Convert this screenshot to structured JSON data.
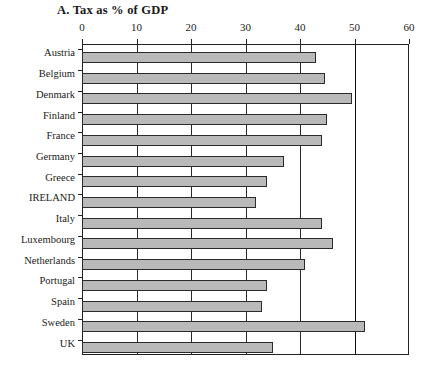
{
  "chart_data": {
    "type": "bar",
    "orientation": "horizontal",
    "title": "A. Tax as % of GDP",
    "xlabel": "",
    "ylabel": "",
    "xlim": [
      0,
      60
    ],
    "xticks": [
      0,
      10,
      20,
      30,
      40,
      50,
      60
    ],
    "grid": true,
    "grid_axis": "x",
    "legend": false,
    "categories": [
      "Austria",
      "Belgium",
      "Denmark",
      "Finland",
      "France",
      "Germany",
      "Greece",
      "IRELAND",
      "Italy",
      "Luxembourg",
      "Netherlands",
      "Portugal",
      "Spain",
      "Sweden",
      "UK"
    ],
    "values": [
      43,
      44.5,
      49.5,
      45,
      44,
      37,
      34,
      32,
      44,
      46,
      41,
      34,
      33,
      52,
      35
    ],
    "series": [
      {
        "name": "Tax as % of GDP",
        "values": [
          43,
          44.5,
          49.5,
          45,
          44,
          37,
          34,
          32,
          44,
          46,
          41,
          34,
          33,
          52,
          35
        ]
      }
    ],
    "bar_fill_color": "#b9b9b9",
    "bar_edge_color": "#2b2b2b",
    "emphasis_gridline_value": 50
  }
}
